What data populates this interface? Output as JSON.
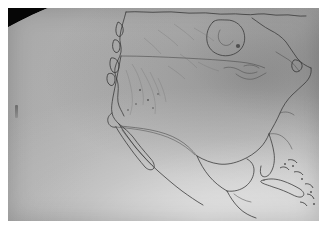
{
  "image": {
    "kind": "satellite-photograph",
    "subject": "North America viewed from space",
    "rendering": "grayscale",
    "alt_text": "Grayscale satellite image of North America showing the curved limb of the Earth with black space in the upper-left and lower-left corners, a bright glare arc over the Pacific Ocean, and coastlines from Alaska and Canada through the United States, Mexico, the Gulf of Mexico and the Caribbean islands.",
    "border": {
      "color": "#ffffff",
      "left_px": 8,
      "top_px": 8,
      "right_px": 6,
      "bottom_px": 14
    },
    "canvas": {
      "width": 325,
      "height": 235
    },
    "photo": {
      "width": 311,
      "height": 213
    }
  },
  "palette": {
    "space_black": "#070707",
    "limb_glare": "#e8e8e8",
    "ocean_light": "#c4c4c4",
    "ocean_mid": "#a6a6a6",
    "ocean_dark": "#8e8e8e",
    "land_bright": "#d6d6d6",
    "coastline": "#3a3a3a",
    "paper_white": "#ffffff"
  },
  "features": [
    {
      "name": "space-limb-upper-left",
      "label": "Space beyond the Earth's limb",
      "region": "upper-left corner"
    },
    {
      "name": "space-limb-lower-left",
      "label": "Space beyond the Earth's limb",
      "region": "lower-left corner"
    },
    {
      "name": "terminator-glare-arc",
      "label": "Bright limb glare arc",
      "region": "Pacific Ocean, northwest"
    },
    {
      "name": "pacific-ocean",
      "label": "Pacific Ocean",
      "region": "left half"
    },
    {
      "name": "alaska-coast",
      "label": "Alaska and Pacific Northwest coast",
      "region": "upper left of continent"
    },
    {
      "name": "canada-landmass",
      "label": "Canada",
      "region": "top center"
    },
    {
      "name": "hudson-bay",
      "label": "Hudson Bay",
      "region": "top center-right"
    },
    {
      "name": "great-lakes",
      "label": "Great Lakes",
      "region": "center right"
    },
    {
      "name": "united-states",
      "label": "Contiguous United States",
      "region": "center"
    },
    {
      "name": "baja-california",
      "label": "Baja California peninsula",
      "region": "lower center-left"
    },
    {
      "name": "mexico",
      "label": "Mexico",
      "region": "lower center"
    },
    {
      "name": "gulf-of-mexico",
      "label": "Gulf of Mexico",
      "region": "lower center-right"
    },
    {
      "name": "florida-peninsula",
      "label": "Florida peninsula",
      "region": "lower right"
    },
    {
      "name": "yucatan-peninsula",
      "label": "Yucatan peninsula",
      "region": "bottom center-right"
    },
    {
      "name": "cuba-island",
      "label": "Cuba",
      "region": "bottom right"
    },
    {
      "name": "caribbean-islands",
      "label": "Caribbean islands",
      "region": "bottom right"
    },
    {
      "name": "atlantic-ocean",
      "label": "Atlantic Ocean",
      "region": "right edge"
    },
    {
      "name": "sensor-artifact",
      "label": "Dark sensor artifact",
      "region": "mid left over the Pacific"
    }
  ]
}
